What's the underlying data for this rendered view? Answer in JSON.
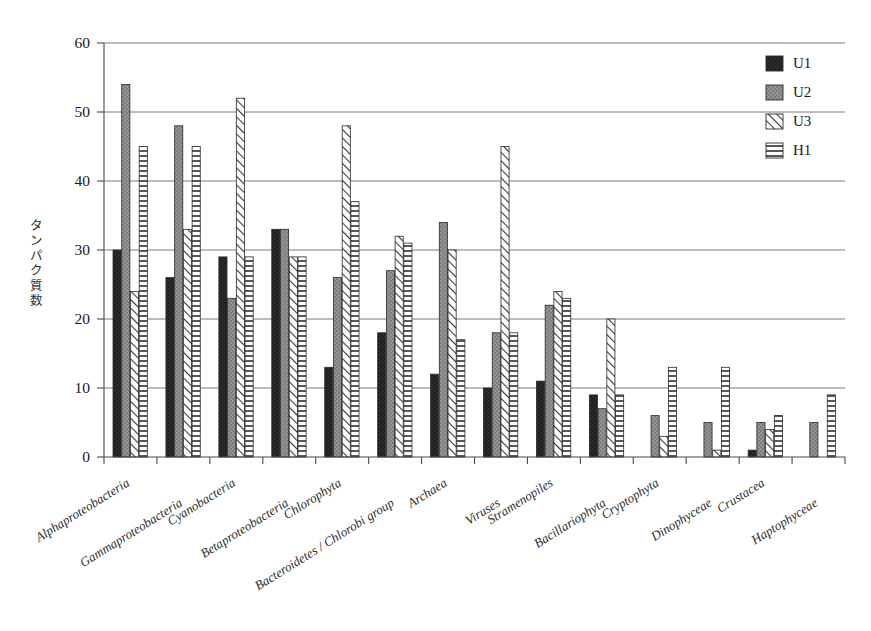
{
  "chart_data": {
    "type": "bar",
    "title": "",
    "xlabel": "",
    "ylabel": "タンパク質数",
    "ylim": [
      0,
      60
    ],
    "ytick_step": 10,
    "yticks": [
      0,
      10,
      20,
      30,
      40,
      50,
      60
    ],
    "grid": "horizontal",
    "legend_position": "top-right",
    "categories": [
      "Alphaproteobacteria",
      "Gammaproteobacteria",
      "Cyanobacteria",
      "Betaproteobacteria",
      "Chlorophyta",
      "Bacteroidetes / Chlorobi group",
      "Archaea",
      "Viruses",
      "Stramenopiles",
      "Bacillariophyta",
      "Cryptophyta",
      "Dinophyceae",
      "Crustacea",
      "Haptophyceae"
    ],
    "series": [
      {
        "name": "U1",
        "pattern": "solid-black",
        "color": "#231f20",
        "values": [
          30,
          26,
          29,
          33,
          13,
          18,
          12,
          10,
          11,
          9,
          0,
          0,
          1,
          0
        ]
      },
      {
        "name": "U2",
        "pattern": "solid-gray",
        "color": "#808080",
        "values": [
          54,
          48,
          23,
          33,
          26,
          27,
          34,
          18,
          22,
          7,
          6,
          5,
          5,
          5
        ]
      },
      {
        "name": "U3",
        "pattern": "diagonal-hatch",
        "color": "#ffffff",
        "values": [
          24,
          33,
          52,
          29,
          48,
          32,
          30,
          45,
          24,
          20,
          3,
          1,
          4,
          0
        ]
      },
      {
        "name": "H1",
        "pattern": "horizontal-lines",
        "color": "#ffffff",
        "values": [
          45,
          45,
          29,
          29,
          37,
          31,
          17,
          18,
          23,
          9,
          13,
          13,
          6,
          9
        ]
      }
    ]
  },
  "legend": {
    "items": [
      {
        "label": "U1",
        "pattern": "solid-black"
      },
      {
        "label": "U2",
        "pattern": "solid-gray"
      },
      {
        "label": "U3",
        "pattern": "diagonal-hatch"
      },
      {
        "label": "H1",
        "pattern": "horizontal-lines"
      }
    ]
  },
  "axis": {
    "y_title": "タンパク質数",
    "y_tick_labels": [
      "0",
      "10",
      "20",
      "30",
      "40",
      "50",
      "60"
    ]
  }
}
